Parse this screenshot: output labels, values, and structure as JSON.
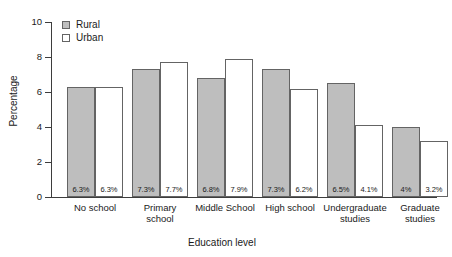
{
  "chart_data": {
    "type": "bar",
    "title": "",
    "subtitle": "",
    "xlabel": "Education level",
    "ylabel": "Percentage",
    "ylim": [
      0,
      10
    ],
    "yticks": [
      "0",
      "2",
      "4",
      "6",
      "8",
      "10"
    ],
    "grid": false,
    "legend_position": "top-left inside plot",
    "categories": [
      "No school",
      "Primary school",
      "Middle School",
      "High school",
      "Undergraduate studies",
      "Graduate studies"
    ],
    "category_lines": [
      [
        "No school"
      ],
      [
        "Primary",
        "school"
      ],
      [
        "Middle School"
      ],
      [
        "High school"
      ],
      [
        "Undergraduate",
        "studies"
      ],
      [
        "Graduate",
        "studies"
      ]
    ],
    "series": [
      {
        "name": "Rural",
        "color": "#bebebe",
        "values": [
          6.3,
          7.3,
          6.8,
          7.3,
          6.5,
          4.0
        ],
        "labels": [
          "6.3%",
          "7.3%",
          "6.8%",
          "7.3%",
          "6.5%",
          "4%"
        ]
      },
      {
        "name": "Urban",
        "color": "#ffffff",
        "values": [
          6.3,
          7.7,
          7.9,
          6.2,
          4.1,
          3.2
        ],
        "labels": [
          "6.3%",
          "7.7%",
          "7.9%",
          "6.2%",
          "4.1%",
          "3.2%"
        ]
      }
    ]
  },
  "legend": {
    "items": [
      {
        "label": "Rural",
        "color": "#bebebe"
      },
      {
        "label": "Urban",
        "color": "#ffffff"
      }
    ]
  },
  "axes": {
    "y_title": "Percentage",
    "x_title": "Education level",
    "y_ticks": [
      "10",
      "8",
      "6",
      "4",
      "2",
      "0"
    ]
  }
}
